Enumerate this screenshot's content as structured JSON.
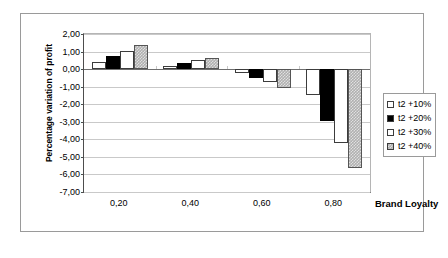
{
  "chart_data": {
    "type": "bar",
    "title": "",
    "xlabel": "Brand Loyalty",
    "ylabel": "Percentage variation of profit",
    "categories": [
      "0,20",
      "0,40",
      "0,60",
      "0,80"
    ],
    "series": [
      {
        "name": "t2 +10%",
        "values": [
          0.4,
          0.2,
          -0.2,
          -1.5
        ],
        "color": "#ffffff",
        "fill": "white"
      },
      {
        "name": "t2 +20%",
        "values": [
          0.75,
          0.35,
          -0.5,
          -2.95
        ],
        "color": "#000000",
        "fill": "black"
      },
      {
        "name": "t2 +30%",
        "values": [
          1.05,
          0.5,
          -0.75,
          -4.2
        ],
        "color": "#ffffff",
        "fill": "white"
      },
      {
        "name": "t2 +40%",
        "values": [
          1.4,
          0.65,
          -1.1,
          -5.65
        ],
        "color": "#b0b0b0",
        "fill": "gray"
      }
    ],
    "ylim": [
      -7.0,
      2.0
    ],
    "ytick_labels": [
      "2,00",
      "1,00",
      "0,00",
      "-1,00",
      "-2,00",
      "-3,00",
      "-4,00",
      "-5,00",
      "-6,00",
      "-7,00"
    ],
    "ytick_values": [
      2.0,
      1.0,
      0.0,
      -1.0,
      -2.0,
      -3.0,
      -4.0,
      -5.0,
      -6.0,
      -7.0
    ],
    "grid": true,
    "legend_position": "right"
  }
}
